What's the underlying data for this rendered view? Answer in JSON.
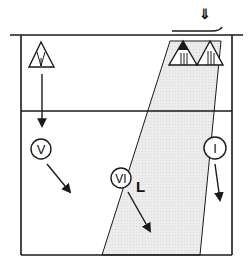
{
  "diagram": {
    "title": "",
    "colors": {
      "line": "#1a1a1a",
      "shade": "#e9e9e9",
      "background": "#ffffff"
    },
    "frame": {
      "top_line": {
        "x1": 10,
        "x2": 243,
        "y": 35
      },
      "left": 21,
      "right": 232,
      "bottom": 255,
      "middle_line_y": 111
    },
    "shaded_beam": {
      "points": [
        [
          170,
          41
        ],
        [
          221,
          41
        ],
        [
          200,
          255
        ],
        [
          102,
          255
        ]
      ]
    },
    "top_marker": {
      "symbol": "double-down-arrow",
      "glyph": "⇓"
    },
    "triangles": [
      {
        "id": "IV",
        "label": "IV",
        "x": 41,
        "y": 53,
        "filled_apex": false
      },
      {
        "id": "III-filled",
        "label": "III",
        "x": 183,
        "y": 53,
        "filled_apex": true
      },
      {
        "id": "III",
        "label": "III",
        "x": 209,
        "y": 53,
        "filled_apex": false
      }
    ],
    "circles": [
      {
        "id": "V",
        "label": "V",
        "x": 41,
        "y": 149
      },
      {
        "id": "VI",
        "label": "VI",
        "x": 121,
        "y": 178,
        "side_label": "L"
      },
      {
        "id": "I",
        "label": "I",
        "x": 215,
        "y": 148
      }
    ],
    "arrows": [
      {
        "from": "IV",
        "x1": 42,
        "y1": 74,
        "x2": 42,
        "y2": 126
      },
      {
        "from": "V",
        "x1": 47,
        "y1": 164,
        "x2": 70,
        "y2": 192
      },
      {
        "from": "VI",
        "x1": 128,
        "y1": 192,
        "x2": 150,
        "y2": 231
      },
      {
        "from": "I",
        "x1": 215,
        "y1": 164,
        "x2": 220,
        "y2": 200
      }
    ],
    "text_labels": {
      "vi_side": "L"
    }
  }
}
